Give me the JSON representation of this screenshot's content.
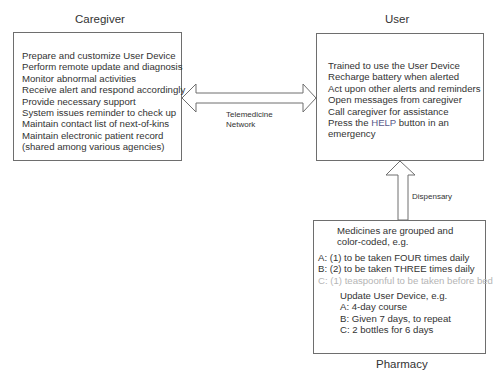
{
  "caregiver": {
    "title": "Caregiver",
    "items": [
      "Prepare and customize User Device",
      "Perform remote update and diagnosis",
      "Monitor abnormal activities",
      "Receive alert and respond accordingly",
      "Provide necessary support",
      "System issues reminder to check up",
      "Maintain contact list of next-of-kins",
      "Maintain electronic patient record",
      "(shared among various agencies)"
    ]
  },
  "user": {
    "title": "User",
    "items": [
      "Trained to use the User Device",
      "Recharge battery when alerted",
      "Act upon other alerts and reminders",
      "Open messages from caregiver",
      "Call caregiver for assistance"
    ],
    "help_line": {
      "prefix": "Press the ",
      "highlight": "HELP",
      "suffix": " button in an"
    },
    "last_line": "emergency"
  },
  "network_link": {
    "label_line1": "Telemedicine",
    "label_line2": "Network"
  },
  "dispensary_link": {
    "label": "Dispensary"
  },
  "pharmacy": {
    "title": "Pharmacy",
    "intro_line1": "Medicines are grouped and",
    "intro_line2": "color-coded, e.g.",
    "groups": [
      "A: (1) to be taken FOUR times daily",
      "B: (2) to be taken THREE times daily",
      "C: (1) teaspoonful to be taken before bed"
    ],
    "update_title": "Update User Device, e.g.",
    "updates": [
      "A: 4-day course",
      "B: Given 7 days, to repeat",
      "C: 2 bottles for 6 days"
    ]
  }
}
